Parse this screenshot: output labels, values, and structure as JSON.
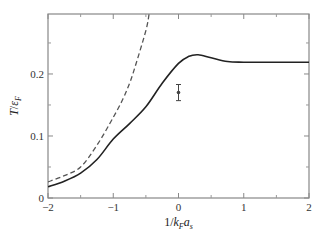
{
  "chart_data": {
    "type": "line",
    "title": "",
    "xlabel": "1/k_F a_s",
    "ylabel": "T/ε_F",
    "xlim": [
      -2,
      2
    ],
    "ylim": [
      0,
      0.3
    ],
    "grid": false,
    "legend": null,
    "x_ticks": [
      -2,
      -1,
      0,
      1,
      2
    ],
    "x_tick_labels": [
      "−2",
      "−1",
      "0",
      "1",
      "2"
    ],
    "x_minor_ticks": [
      -1.5,
      -0.5,
      0.5,
      1.5
    ],
    "y_ticks": [
      0,
      0.1,
      0.2
    ],
    "y_tick_labels": [
      "0",
      "0.1",
      "0.2"
    ],
    "y_minor_ticks": [
      0.05,
      0.15,
      0.25
    ],
    "series": [
      {
        "name": "solid-curve",
        "style": "solid",
        "color": "#222222",
        "x": [
          -2,
          -1.75,
          -1.5,
          -1.25,
          -1,
          -0.75,
          -0.5,
          -0.25,
          0,
          0.15,
          0.3,
          0.5,
          0.75,
          1,
          1.5,
          2
        ],
        "y": [
          0.018,
          0.027,
          0.04,
          0.062,
          0.095,
          0.12,
          0.147,
          0.185,
          0.217,
          0.228,
          0.231,
          0.226,
          0.22,
          0.219,
          0.219,
          0.219
        ]
      },
      {
        "name": "dashed-curve",
        "style": "dashed",
        "color": "#555555",
        "x": [
          -2,
          -1.75,
          -1.5,
          -1.25,
          -1,
          -0.85,
          -0.75,
          -0.67,
          -0.5,
          -0.45
        ],
        "y": [
          0.026,
          0.036,
          0.05,
          0.085,
          0.13,
          0.16,
          0.185,
          0.21,
          0.27,
          0.297
        ]
      },
      {
        "name": "data-point",
        "style": "marker-errorbar",
        "color": "#444444",
        "x": [
          0
        ],
        "y": [
          0.17
        ],
        "yerr": [
          0.013
        ]
      }
    ]
  }
}
